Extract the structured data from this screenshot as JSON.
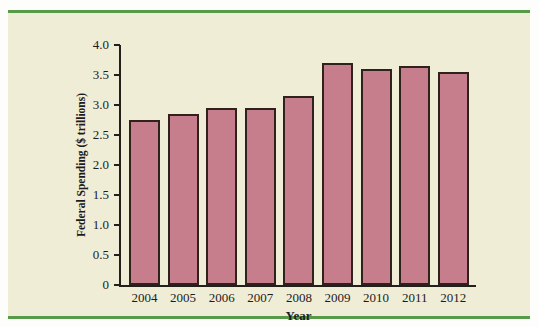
{
  "figure": {
    "background": "#f0edd6",
    "rule_color": "#579a48",
    "axis_color": "#231f1c"
  },
  "chart_data": {
    "type": "bar",
    "title": "",
    "xlabel": "Year",
    "ylabel": "Federal Spending ($ trillions)",
    "categories": [
      "2004",
      "2005",
      "2006",
      "2007",
      "2008",
      "2009",
      "2010",
      "2011",
      "2012"
    ],
    "values": [
      2.75,
      2.85,
      2.95,
      2.95,
      3.15,
      3.7,
      3.6,
      3.65,
      3.55
    ],
    "ylim": [
      0,
      4.0
    ],
    "ytick_step": 0.5,
    "ytick_labels": [
      "0",
      "0.5",
      "1.0",
      "1.5",
      "2.0",
      "2.5",
      "3.0",
      "3.5",
      "4.0"
    ],
    "grid": false,
    "legend": "none",
    "bar_color": "#c67e8c",
    "bar_border_color": "#30211c"
  }
}
